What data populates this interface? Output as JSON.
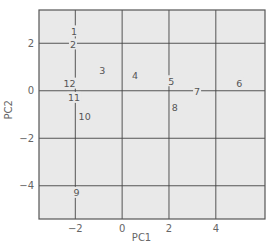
{
  "chart_data": {
    "type": "scatter",
    "title": "",
    "xlabel": "PC1",
    "ylabel": "PC2",
    "xlim": [
      -3.55,
      6.1
    ],
    "ylim": [
      -5.4,
      3.4
    ],
    "xticks": [
      -2,
      0,
      2,
      4
    ],
    "yticks": [
      -4,
      -2,
      0,
      2
    ],
    "grid": true,
    "marker": "text-label",
    "points": [
      {
        "label": "1",
        "x": -2.05,
        "y": 2.5
      },
      {
        "label": "2",
        "x": -2.1,
        "y": 1.95
      },
      {
        "label": "3",
        "x": -0.85,
        "y": 0.85
      },
      {
        "label": "4",
        "x": 0.55,
        "y": 0.65
      },
      {
        "label": "5",
        "x": 2.1,
        "y": 0.4
      },
      {
        "label": "6",
        "x": 5.0,
        "y": 0.3
      },
      {
        "label": "7",
        "x": 3.2,
        "y": -0.05
      },
      {
        "label": "8",
        "x": 2.25,
        "y": -0.7
      },
      {
        "label": "9",
        "x": -1.95,
        "y": -4.3
      },
      {
        "label": "10",
        "x": -1.6,
        "y": -1.1
      },
      {
        "label": "11",
        "x": -2.05,
        "y": -0.3
      },
      {
        "label": "12",
        "x": -2.25,
        "y": 0.3
      }
    ]
  },
  "colors": {
    "plot_background": "#e9e9e9",
    "grid": "#444444",
    "frame": "#555555",
    "text": "#555555"
  }
}
